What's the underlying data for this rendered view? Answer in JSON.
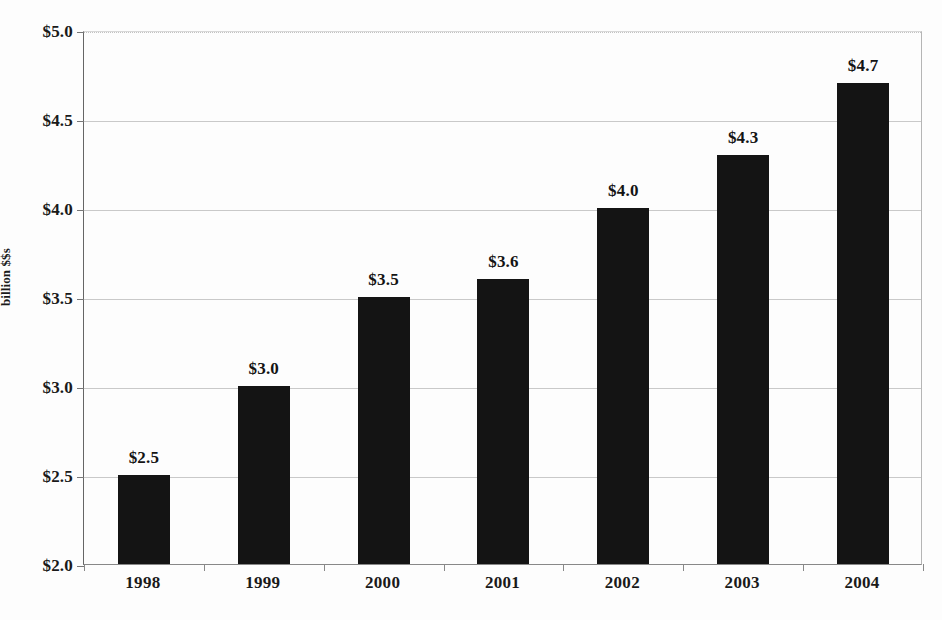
{
  "chart_data": {
    "type": "bar",
    "title": "",
    "xlabel": "",
    "ylabel": "billion $$s",
    "categories": [
      "1998",
      "1999",
      "2000",
      "2001",
      "2002",
      "2003",
      "2004"
    ],
    "values": [
      2.5,
      3.0,
      3.5,
      3.6,
      4.0,
      4.3,
      4.7
    ],
    "data_labels": [
      "$2.5",
      "$3.0",
      "$3.5",
      "$3.6",
      "$4.0",
      "$4.3",
      "$4.7"
    ],
    "ylim": [
      2.0,
      5.0
    ],
    "ytick_values": [
      2.0,
      2.5,
      3.0,
      3.5,
      4.0,
      4.5,
      5.0
    ],
    "ytick_labels": [
      "$2.0",
      "$2.5",
      "$3.0",
      "$3.5",
      "$4.0",
      "$4.5",
      "$5.0"
    ],
    "grid": true,
    "legend": "none",
    "bar_color": "#141414",
    "grid_color": "#c9c9c9",
    "axis_color": "#888888",
    "background_color": "#fdfdfd"
  },
  "axes": {
    "y_title": "billion $$s"
  }
}
